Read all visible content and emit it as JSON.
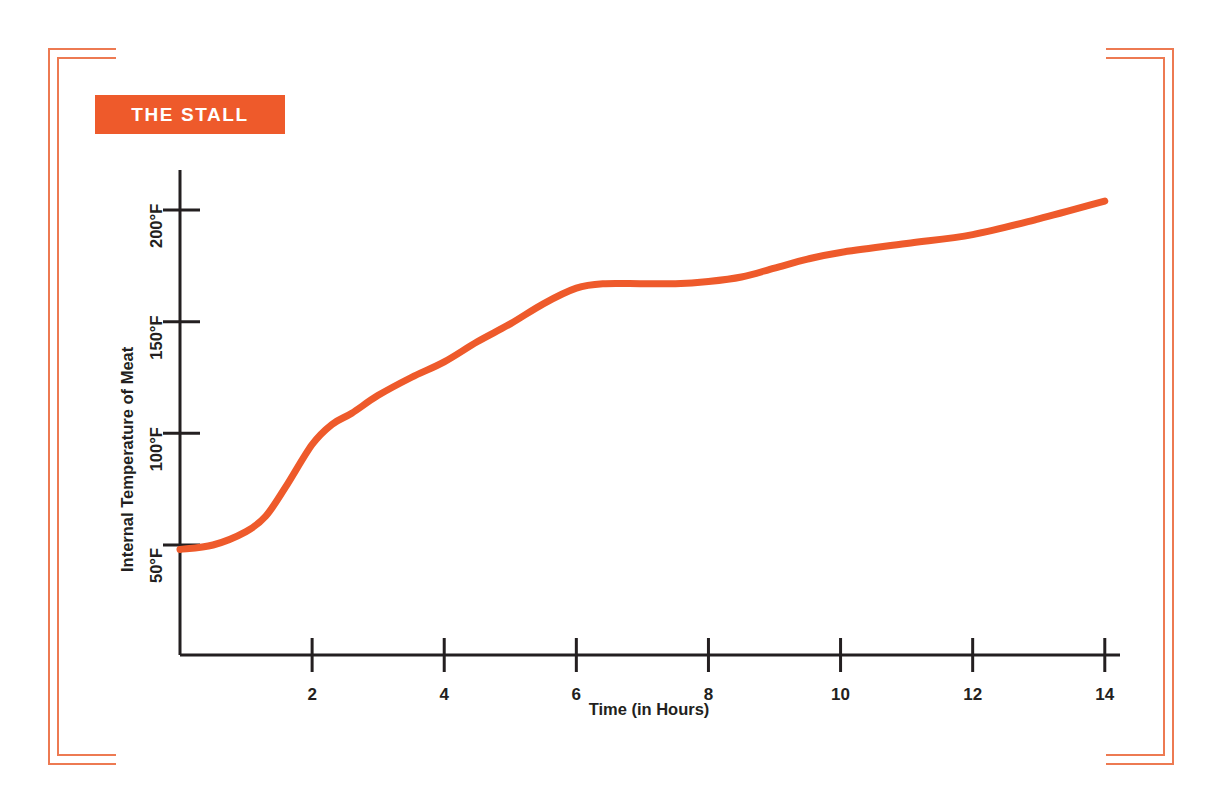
{
  "badge": {
    "label": "THE STALL"
  },
  "theme": {
    "accent": "#EE5A2B",
    "frame": "#ED7A52",
    "ink": "#231f20",
    "background": "#ffffff"
  },
  "chart_data": {
    "type": "line",
    "title": "THE STALL",
    "xlabel": "Time (in Hours)",
    "ylabel": "Internal Temperature of Meat",
    "xlim": [
      0,
      14.2
    ],
    "ylim": [
      0,
      215
    ],
    "grid": false,
    "legend": "none",
    "xticks": [
      2,
      4,
      6,
      8,
      10,
      12,
      14
    ],
    "xtick_labels": [
      "2",
      "4",
      "6",
      "8",
      "10",
      "12",
      "14"
    ],
    "yticks": [
      50,
      100,
      150,
      200
    ],
    "ytick_labels": [
      "50°F",
      "100°F",
      "150°F",
      "200°F"
    ],
    "series": [
      {
        "name": "Internal Temperature of Meat",
        "color": "#EE5A2B",
        "x": [
          0.0,
          0.5,
          1.0,
          1.3,
          1.6,
          2.0,
          2.3,
          2.6,
          3.0,
          3.5,
          4.0,
          4.5,
          5.0,
          5.5,
          6.0,
          6.4,
          7.0,
          7.5,
          8.0,
          8.5,
          9.0,
          9.5,
          10.0,
          11.0,
          12.0,
          13.0,
          14.0
        ],
        "y": [
          48,
          50,
          56,
          63,
          76,
          95,
          104,
          109,
          117,
          125,
          132,
          141,
          149,
          158,
          165,
          167,
          167,
          167,
          168,
          170,
          174,
          178,
          181,
          185,
          189,
          196,
          204
        ]
      }
    ],
    "annotations": [
      {
        "text": "THE STALL",
        "note": "plateau in internal temperature between roughly 6 and 8 hours at about 167°F"
      }
    ]
  }
}
